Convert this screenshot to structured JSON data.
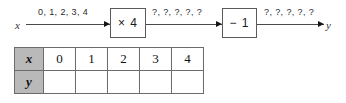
{
  "diagram": {
    "input_variable": "x",
    "output_variable": "y",
    "arrow_labels": {
      "input": "0, 1, 2, 3, 4",
      "middle": "?, ?, ?, ?, ?",
      "output": "?, ?, ?, ?, ?"
    },
    "operations": [
      {
        "label": "× 4"
      },
      {
        "label": "− 1"
      }
    ]
  },
  "table": {
    "rows": [
      {
        "header": "x",
        "cells": [
          "0",
          "1",
          "2",
          "3",
          "4"
        ]
      },
      {
        "header": "y",
        "cells": [
          "",
          "",
          "",
          "",
          ""
        ]
      }
    ]
  },
  "colors": {
    "header_fill": "#b9b9b9",
    "border": "#6b6b6b",
    "line": "#4a4a4a",
    "background": "#ffffff"
  }
}
